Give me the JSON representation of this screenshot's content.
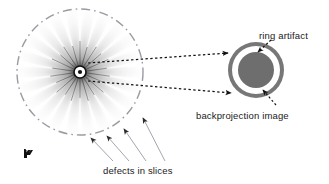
{
  "figure": {
    "width": 329,
    "height": 184,
    "background": "#ffffff",
    "type": "annotated-diagram"
  },
  "labels": {
    "ring_artifact": "ring artifact",
    "backprojection_image": "backprojection image",
    "defects_in_slices": "defects in slices"
  },
  "colors": {
    "text": "#1a1a1a",
    "leader_line": "#8c8c96",
    "dotted_arrow": "#111111",
    "disc_outer_ring": "#777777",
    "disc_white_ring": "#ffffff",
    "disc_core": "#6e6e6e",
    "dashed_circle": "#9a9aa2",
    "starburst": "#555555",
    "corner_mark": "#111111"
  },
  "starburst": {
    "center_x": 80,
    "center_y": 72,
    "ray_count": 22,
    "ray_length": 62,
    "hub_radius": 6,
    "dot_radius": 2,
    "dashed_circle_radius": 63
  },
  "backprojection_disc": {
    "center_x": 256,
    "center_y": 70,
    "outer_radius": 28,
    "white_ring_outer_radius": 24,
    "core_radius": 18
  },
  "pointer_arrows": {
    "dotted": [
      {
        "name": "upper-projection-ray",
        "x1": 88,
        "y1": 62,
        "x2": 231,
        "y2": 54
      },
      {
        "name": "lower-projection-ray",
        "x1": 88,
        "y1": 81,
        "x2": 234,
        "y2": 93
      }
    ],
    "dashed_callouts": [
      {
        "name": "ring-artifact-pointer",
        "x1": 269,
        "y1": 41,
        "x2": 257,
        "y2": 53
      },
      {
        "name": "backprojection-pointer",
        "x1": 273,
        "y1": 104,
        "x2": 262,
        "y2": 91
      }
    ],
    "defect_leaders": [
      {
        "name": "defect-leader-1",
        "x1": 113,
        "y1": 163,
        "x2": 90,
        "y2": 137
      },
      {
        "name": "defect-leader-2",
        "x1": 128,
        "y1": 163,
        "x2": 105,
        "y2": 135
      },
      {
        "name": "defect-leader-3",
        "x1": 145,
        "y1": 163,
        "x2": 123,
        "y2": 128
      },
      {
        "name": "defect-leader-4",
        "x1": 163,
        "y1": 163,
        "x2": 142,
        "y2": 118
      }
    ]
  },
  "corner_mark": {
    "x": 26,
    "y": 150,
    "glyph": "small-dark-mark"
  }
}
